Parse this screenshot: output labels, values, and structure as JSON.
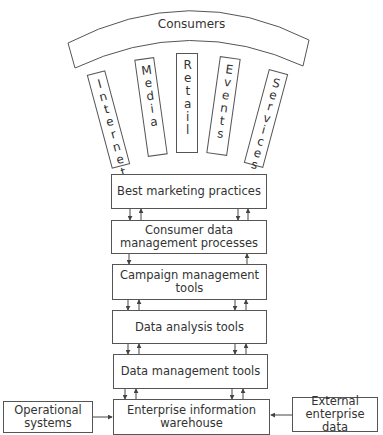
{
  "diagram": {
    "arc": {
      "label": "Consumers"
    },
    "channels": [
      {
        "id": "internet",
        "label": "Internet"
      },
      {
        "id": "media",
        "label": "Media"
      },
      {
        "id": "retail",
        "label": "Retail"
      },
      {
        "id": "events",
        "label": "Events"
      },
      {
        "id": "services",
        "label": "Services"
      }
    ],
    "stack": [
      {
        "id": "best-marketing-practices",
        "label": "Best marketing practices"
      },
      {
        "id": "consumer-data-management-processes",
        "label": "Consumer data\nmanagement processes"
      },
      {
        "id": "campaign-management-tools",
        "label": "Campaign management\ntools"
      },
      {
        "id": "data-analysis-tools",
        "label": "Data analysis tools"
      },
      {
        "id": "data-management-tools",
        "label": "Data management tools"
      },
      {
        "id": "enterprise-information-warehouse",
        "label": "Enterprise information\nwarehouse"
      }
    ],
    "sources": {
      "left": {
        "id": "operational-systems",
        "label": "Operational\nsystems"
      },
      "right": {
        "id": "external-enterprise-data",
        "label": "External\nenterprise data"
      }
    },
    "colors": {
      "line": "#555555",
      "text": "#333333",
      "background": "#ffffff"
    }
  }
}
